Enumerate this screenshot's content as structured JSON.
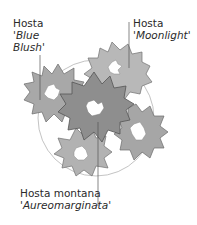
{
  "labels": {
    "blue_blush": {
      "genus": "Hosta",
      "cultivar_line1": "'Blue",
      "cultivar_line2": "Blush'"
    },
    "moonlight": {
      "genus": "Hosta",
      "cultivar": "'Moonlight'"
    },
    "aureomarginata": {
      "species": "Hosta montana",
      "cultivar": "'Aureomarginata'"
    }
  },
  "colors": {
    "background": "#ffffff",
    "text": "#2a2a2a",
    "leaf_dark": "#8a8a8a",
    "leaf_mid": "#a6a6a6",
    "leaf_light": "#bcbcbc",
    "outline": "#6a6a6a",
    "circle": "#b0b0b0"
  }
}
